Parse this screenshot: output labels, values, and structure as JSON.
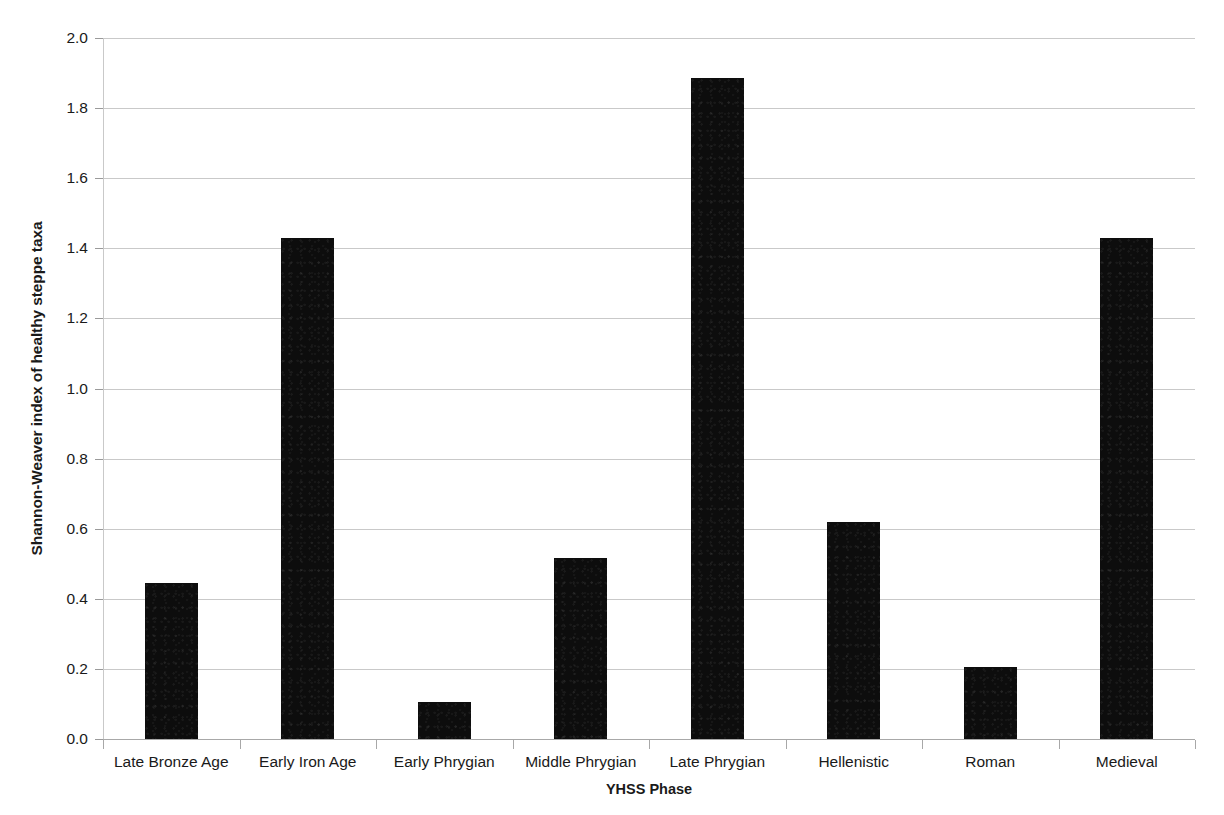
{
  "chart_data": {
    "type": "bar",
    "title": "",
    "subtitle": "",
    "xlabel": "YHSS Phase",
    "ylabel": "Shannon-Weaver index of healthy steppe taxa",
    "categories": [
      "Late Bronze Age",
      "Early Iron Age",
      "Early Phrygian",
      "Middle Phrygian",
      "Late Phrygian",
      "Hellenistic",
      "Roman",
      "Medieval"
    ],
    "values": [
      0.445,
      1.43,
      0.105,
      0.515,
      1.885,
      0.62,
      0.205,
      1.43
    ],
    "ylim": [
      0.0,
      2.0
    ],
    "ytick_labels": [
      "0.0",
      "0.2",
      "0.4",
      "0.6",
      "0.8",
      "1.0",
      "1.2",
      "1.4",
      "1.6",
      "1.8",
      "2.0"
    ],
    "ytick_values": [
      0.0,
      0.2,
      0.4,
      0.6,
      0.8,
      1.0,
      1.2,
      1.4,
      1.6,
      1.8,
      2.0
    ],
    "ytick_step": 0.2,
    "grid": "horizontal",
    "legend": "none",
    "series_name": "Shannon-Weaver index of healthy steppe taxa",
    "colors": {
      "bar": "#0d0d0d",
      "gridline": "#c9c9c9",
      "axis": "#a8a8a8",
      "text": "#1a1a1a",
      "background": "#ffffff"
    }
  }
}
